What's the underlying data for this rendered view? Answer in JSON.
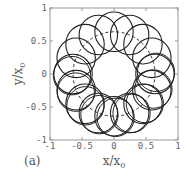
{
  "chart_data": {
    "type": "scatter",
    "title": "",
    "panel_label": "(a)",
    "xlabel": "x/x0",
    "ylabel": "y/x0",
    "xlim": [
      -1,
      1
    ],
    "ylim": [
      -1,
      1
    ],
    "xticks": [
      -1,
      -0.5,
      0,
      0.5,
      1
    ],
    "yticks": [
      -1,
      -0.5,
      0,
      0.5,
      1
    ],
    "xtick_labels": [
      "-1",
      "-0.5",
      "0",
      "0.5",
      "1"
    ],
    "ytick_labels": [
      "-1",
      "-0.5",
      "0",
      "0.5",
      "1"
    ],
    "grid": false,
    "guide_circle": {
      "style": "dashed",
      "center": [
        0,
        0
      ],
      "radius": 0.64
    },
    "ring_circles": {
      "count": 16,
      "orbit_radius": 0.64,
      "circle_radius": 0.3,
      "doubled_in_lower_half": true
    }
  },
  "labels": {
    "panel": "(a)",
    "xlabel_main": "x/x",
    "xlabel_sub": "0",
    "ylabel_main": "y/x",
    "ylabel_sub": "0"
  }
}
